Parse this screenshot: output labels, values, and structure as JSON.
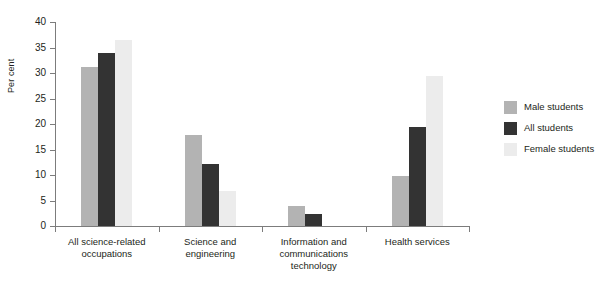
{
  "chart_data": {
    "type": "bar",
    "title": "",
    "subtitle": "",
    "xlabel": "",
    "ylabel": "Per cent",
    "ylim": [
      0,
      40
    ],
    "yticks": [
      0,
      5,
      10,
      15,
      20,
      25,
      30,
      35,
      40
    ],
    "grid": false,
    "legend_position": "right",
    "categories": [
      "All science-related occupations",
      "Science and engineering",
      "Information and communications technology",
      "Health services"
    ],
    "category_lines": [
      [
        "All science-related",
        "occupations"
      ],
      [
        "Science and",
        "engineering"
      ],
      [
        "Information and",
        "communications",
        "technology"
      ],
      [
        "Health services"
      ]
    ],
    "series": [
      {
        "name": "Male students",
        "color": "#b3b3b3",
        "values": [
          31.2,
          17.9,
          3.9,
          9.9
        ]
      },
      {
        "name": "All students",
        "color": "#333333",
        "values": [
          34.0,
          12.2,
          2.3,
          19.5
        ]
      },
      {
        "name": "Female students",
        "color": "#ececec",
        "values": [
          36.5,
          6.8,
          0.0,
          29.4
        ]
      }
    ]
  },
  "axes": {
    "y_title": "Per cent",
    "y_tick_labels": [
      "0",
      "5",
      "10",
      "15",
      "20",
      "25",
      "30",
      "35",
      "40"
    ]
  },
  "legend": {
    "items": [
      {
        "label": "Male students",
        "swatch": "male"
      },
      {
        "label": "All students",
        "swatch": "all"
      },
      {
        "label": "Female students",
        "swatch": "female"
      }
    ]
  }
}
